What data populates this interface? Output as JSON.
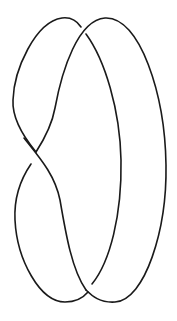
{
  "diagram": {
    "type": "knot-diagram",
    "title": "",
    "stroke_color": "#1a1a1a",
    "background_color": "#ffffff",
    "crossing_count": 3,
    "crossings": [
      {
        "id": "top-crossing",
        "position": "top-center"
      },
      {
        "id": "middle-crossing",
        "position": "middle-left"
      },
      {
        "id": "bottom-crossing",
        "position": "bottom-center"
      }
    ],
    "strands": [
      {
        "id": "left-top-arc",
        "description": "left lobe arc from middle crossing over top to top crossing"
      },
      {
        "id": "outer-loop",
        "description": "large right loop over top crossing, around right side, to bottom crossing"
      },
      {
        "id": "inner-arc",
        "description": "inner right arc from top crossing down to bottom crossing"
      },
      {
        "id": "lower-left-arc",
        "description": "lower left lobe from middle crossing around bottom"
      },
      {
        "id": "diagonal-strand",
        "description": "strand crossing from upper left through middle crossing down to bottom crossing"
      }
    ]
  }
}
